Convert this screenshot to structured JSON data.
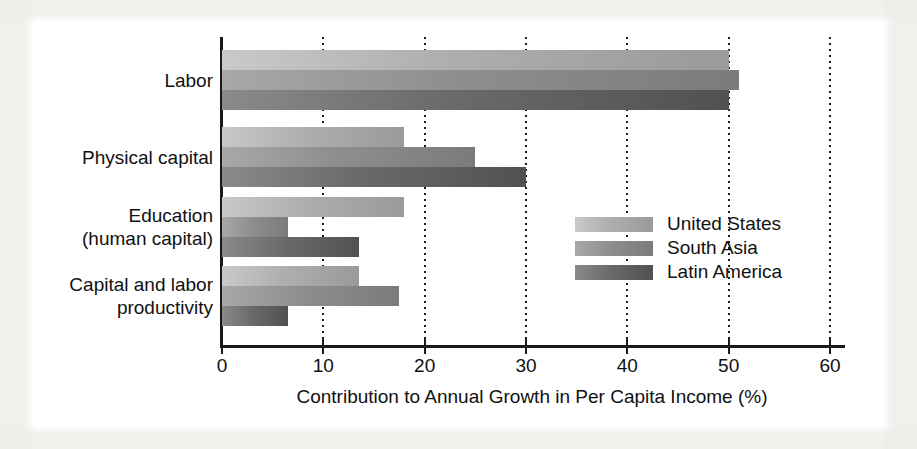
{
  "figure": {
    "background_color": "#f4f4f2",
    "plate_color": "#ffffff"
  },
  "chart_data": {
    "type": "bar",
    "orientation": "horizontal",
    "title": "",
    "xlabel": "Contribution to Annual Growth in Per Capita Income (%)",
    "ylabel": "",
    "xlim": [
      0,
      60
    ],
    "xticks": [
      0,
      10,
      20,
      30,
      40,
      50,
      60
    ],
    "xtick_labels": [
      "0",
      "10",
      "20",
      "30",
      "40",
      "50",
      "60"
    ],
    "grid": "vertical dotted gridlines at every x tick",
    "legend_position": "inside middle-right",
    "categories": [
      "Labor",
      "Physical capital",
      "Education (human capital)",
      "Capital and labor productivity"
    ],
    "category_label_lines": [
      [
        "Labor"
      ],
      [
        "Physical capital"
      ],
      [
        "Education",
        "(human capital)"
      ],
      [
        "Capital and labor",
        "productivity"
      ]
    ],
    "series": [
      {
        "name": "United States",
        "color": "#aeaeae",
        "values": [
          50,
          18,
          18,
          13.5
        ]
      },
      {
        "name": "South Asia",
        "color": "#8e8e8e",
        "values": [
          51,
          25,
          6.5,
          17.5
        ]
      },
      {
        "name": "Latin America",
        "color": "#6a6a6a",
        "values": [
          50,
          30,
          13.5,
          6.5
        ]
      }
    ]
  },
  "legend": {
    "entries": [
      {
        "label": "United States"
      },
      {
        "label": "South Asia"
      },
      {
        "label": "Latin America"
      }
    ]
  }
}
